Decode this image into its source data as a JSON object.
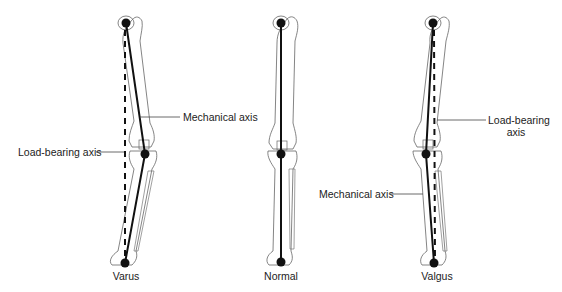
{
  "figure": {
    "legs": [
      {
        "id": "varus",
        "caption": "Varus"
      },
      {
        "id": "normal",
        "caption": "Normal"
      },
      {
        "id": "valgus",
        "caption": "Valgus"
      }
    ],
    "labels": {
      "varus_mechanical_axis": "Mechanical axis",
      "varus_load_bearing_axis": "Load-bearing axis",
      "valgus_load_bearing_axis_line1": "Load-bearing",
      "valgus_load_bearing_axis_line2": "axis",
      "valgus_mechanical_axis": "Mechanical axis"
    },
    "colors": {
      "line": "#111111",
      "bone_outline": "#555555",
      "leader": "#444444"
    }
  }
}
